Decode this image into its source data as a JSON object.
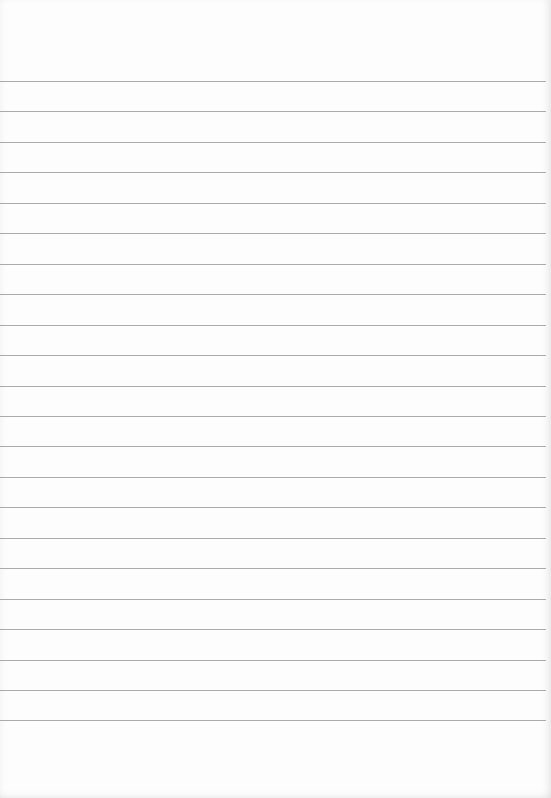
{
  "paper": {
    "type": "lined-notebook-page",
    "background_color": "#fdfdfd",
    "line_color": "#9c9c9c",
    "line_count": 22,
    "first_line_y": 81,
    "line_spacing": 30.45
  }
}
